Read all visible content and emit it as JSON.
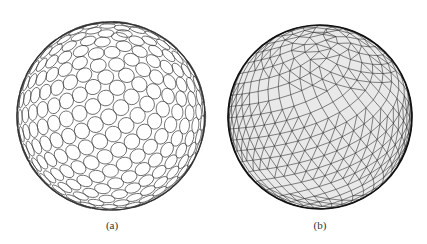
{
  "figure": {
    "panels": [
      {
        "id": "a",
        "label": "(a)",
        "description": "sphere packed with circles (circle packing on sphere surface)",
        "center": [
          111,
          116
        ],
        "radius": 94,
        "stroke_color": "#444444"
      },
      {
        "id": "b",
        "label": "(b)",
        "description": "sphere triangulated geodesic mesh",
        "center": [
          107,
          117
        ],
        "radius": 92,
        "stroke_color": "#222222"
      }
    ]
  }
}
